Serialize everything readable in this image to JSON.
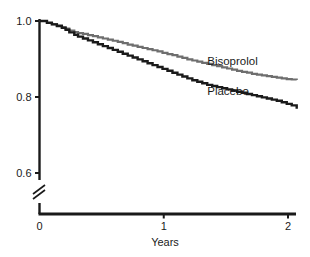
{
  "chart_data": {
    "type": "line",
    "title": "",
    "subtitle": "",
    "xlabel": "Years",
    "ylabel": "",
    "xlim": [
      0,
      2.07
    ],
    "ylim": [
      0.74,
      1.0
    ],
    "grid": false,
    "legend_position": "inline-annotation",
    "x_ticks": [
      {
        "value": 0,
        "label": "0"
      },
      {
        "value": 1,
        "label": "1"
      },
      {
        "value": 2,
        "label": "2"
      }
    ],
    "y_ticks": [
      {
        "value": 1.0,
        "label": "1.0"
      },
      {
        "value": 0.8,
        "label": "0.8"
      },
      {
        "value": 0.6,
        "label": "0.6"
      }
    ],
    "y_axis_break": true,
    "y_axis_break_note": "axis break between 0.6 and baseline",
    "annotations": [
      {
        "text": "Bisoprolol",
        "x": 1.35,
        "y": 0.885,
        "series": "Bisoprolol"
      },
      {
        "text": "Placebo",
        "x": 1.35,
        "y": 0.805,
        "series": "Placebo"
      }
    ],
    "series": [
      {
        "name": "Bisoprolol",
        "color": "#6e6e6e",
        "x": [
          0.0,
          0.06,
          0.1,
          0.14,
          0.18,
          0.21,
          0.24,
          0.28,
          0.31,
          0.35,
          0.39,
          0.43,
          0.47,
          0.51,
          0.55,
          0.59,
          0.63,
          0.67,
          0.71,
          0.75,
          0.79,
          0.83,
          0.87,
          0.91,
          0.95,
          0.99,
          1.03,
          1.07,
          1.11,
          1.15,
          1.19,
          1.23,
          1.27,
          1.31,
          1.35,
          1.39,
          1.43,
          1.47,
          1.51,
          1.55,
          1.59,
          1.63,
          1.67,
          1.71,
          1.75,
          1.79,
          1.83,
          1.87,
          1.91,
          1.95,
          1.99,
          2.03,
          2.07
        ],
        "y": [
          1.0,
          0.996,
          0.992,
          0.988,
          0.984,
          0.98,
          0.975,
          0.971,
          0.968,
          0.966,
          0.963,
          0.96,
          0.957,
          0.954,
          0.951,
          0.948,
          0.945,
          0.942,
          0.938,
          0.935,
          0.932,
          0.929,
          0.926,
          0.923,
          0.92,
          0.916,
          0.913,
          0.91,
          0.906,
          0.903,
          0.899,
          0.896,
          0.893,
          0.89,
          0.887,
          0.884,
          0.881,
          0.878,
          0.875,
          0.872,
          0.869,
          0.866,
          0.864,
          0.861,
          0.859,
          0.857,
          0.855,
          0.853,
          0.851,
          0.849,
          0.847,
          0.846,
          0.845
        ]
      },
      {
        "name": "Placebo",
        "color": "#1a1a1a",
        "x": [
          0.0,
          0.06,
          0.1,
          0.14,
          0.18,
          0.21,
          0.24,
          0.28,
          0.31,
          0.35,
          0.39,
          0.43,
          0.47,
          0.51,
          0.55,
          0.59,
          0.63,
          0.67,
          0.71,
          0.75,
          0.79,
          0.83,
          0.87,
          0.91,
          0.95,
          0.99,
          1.03,
          1.07,
          1.11,
          1.15,
          1.19,
          1.23,
          1.27,
          1.31,
          1.35,
          1.39,
          1.43,
          1.47,
          1.51,
          1.55,
          1.59,
          1.63,
          1.67,
          1.71,
          1.75,
          1.79,
          1.83,
          1.87,
          1.91,
          1.95,
          1.99,
          2.03,
          2.07
        ],
        "y": [
          1.0,
          0.995,
          0.991,
          0.987,
          0.982,
          0.977,
          0.97,
          0.964,
          0.959,
          0.954,
          0.949,
          0.944,
          0.939,
          0.934,
          0.929,
          0.924,
          0.919,
          0.914,
          0.909,
          0.904,
          0.899,
          0.894,
          0.889,
          0.884,
          0.879,
          0.874,
          0.869,
          0.864,
          0.859,
          0.854,
          0.849,
          0.844,
          0.84,
          0.836,
          0.832,
          0.829,
          0.826,
          0.823,
          0.82,
          0.817,
          0.814,
          0.811,
          0.808,
          0.805,
          0.802,
          0.799,
          0.796,
          0.793,
          0.79,
          0.786,
          0.782,
          0.778,
          0.769
        ]
      }
    ]
  }
}
